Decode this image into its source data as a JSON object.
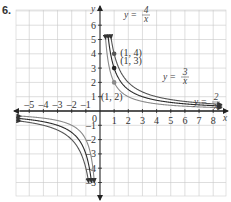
{
  "problem_number": "6.",
  "colors": {
    "grid": "#c8c8c8",
    "axis": "#222222",
    "curve_2_over_x": "#8a8a8a",
    "curve_3_over_x": "#2a2a2a",
    "curve_4_over_x": "#555555",
    "point_1_2": "#8a8a8a",
    "point_1_3": "#222222",
    "point_1_4": "#555555"
  },
  "chart_data": {
    "type": "line",
    "title": "",
    "xlabel": "x",
    "ylabel": "y",
    "xlim": [
      -5.8,
      8.8
    ],
    "ylim": [
      -5.8,
      6.9
    ],
    "grid": true,
    "x_ticks": [
      "-5",
      "-4",
      "-3",
      "-2",
      "-1",
      "0",
      "1",
      "2",
      "3",
      "4",
      "5",
      "6",
      "7",
      "8"
    ],
    "y_ticks": [
      "6",
      "5",
      "4",
      "3",
      "2",
      "1",
      "-1",
      "-2",
      "-3",
      "-4",
      "-5"
    ],
    "series": [
      {
        "name": "y = 2/x",
        "numerator": 2,
        "label_num": "2",
        "label_den": "x",
        "function": "2/x"
      },
      {
        "name": "y = 3/x",
        "numerator": 3,
        "label_num": "3",
        "label_den": "x",
        "function": "3/x"
      },
      {
        "name": "y = 4/x",
        "numerator": 4,
        "label_num": "4",
        "label_den": "x",
        "function": "4/x"
      }
    ],
    "points": [
      {
        "x": 1,
        "y": 2,
        "label": "(1, 2)"
      },
      {
        "x": 1,
        "y": 3,
        "label": "(1, 3)"
      },
      {
        "x": 1,
        "y": 4,
        "label": "(1, 4)"
      }
    ],
    "annotations": [
      "y =",
      "0"
    ]
  }
}
